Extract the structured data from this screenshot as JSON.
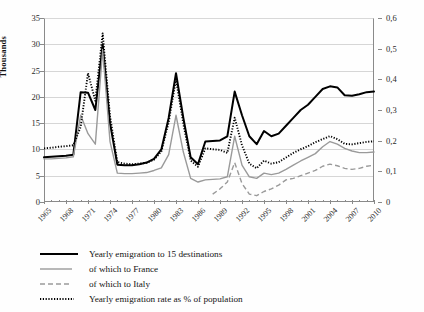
{
  "chart_data": {
    "type": "line",
    "title": "",
    "xlabel": "",
    "ylabel": "Thousands",
    "y2label": "",
    "xlim": [
      1965,
      2010
    ],
    "ylim": [
      0,
      35
    ],
    "y2lim": [
      0,
      0.6
    ],
    "grid": true,
    "legend_position": "bottom-left",
    "x": [
      1965,
      1966,
      1967,
      1968,
      1969,
      1970,
      1971,
      1972,
      1973,
      1974,
      1975,
      1976,
      1977,
      1978,
      1979,
      1980,
      1981,
      1982,
      1983,
      1984,
      1985,
      1986,
      1987,
      1988,
      1989,
      1990,
      1991,
      1992,
      1993,
      1994,
      1995,
      1996,
      1997,
      1998,
      1999,
      2000,
      2001,
      2002,
      2003,
      2004,
      2005,
      2006,
      2007,
      2008,
      2009,
      2010
    ],
    "y_left_ticks": [
      "0",
      "5",
      "10",
      "15",
      "20",
      "25",
      "30",
      "35"
    ],
    "y_right_ticks": [
      "0",
      "0,1",
      "0,2",
      "0,3",
      "0,4",
      "0,5",
      "0,6"
    ],
    "x_ticks": [
      "1965",
      "1968",
      "1971",
      "1974",
      "1977",
      "1980",
      "1983",
      "1986",
      "1989",
      "1992",
      "1995",
      "1998",
      "2001",
      "2004",
      "2007",
      "2010"
    ],
    "series": [
      {
        "name": "Yearly emigration to 15 destinations",
        "key": "total",
        "axis": "left",
        "style": "solid-thick",
        "color": "#000000",
        "values": [
          8.5,
          8.6,
          8.7,
          8.8,
          9.0,
          20.9,
          20.8,
          17.5,
          30.0,
          15.0,
          7.1,
          7.0,
          7.0,
          7.2,
          7.5,
          8.2,
          10.0,
          16.0,
          24.5,
          16.0,
          8.5,
          7.2,
          11.5,
          11.6,
          11.7,
          12.5,
          21.0,
          16.5,
          12.5,
          11.0,
          13.5,
          12.5,
          13.0,
          14.5,
          16.0,
          17.5,
          18.5,
          20.0,
          21.5,
          22.0,
          21.8,
          20.3,
          20.2,
          20.5,
          20.9,
          21.0
        ]
      },
      {
        "name": "of which to France",
        "key": "france",
        "axis": "left",
        "style": "solid-thin",
        "color": "#9a9a9a",
        "values": [
          8.2,
          8.2,
          8.3,
          8.4,
          8.6,
          16.5,
          13.0,
          11.0,
          29.0,
          11.5,
          5.5,
          5.4,
          5.4,
          5.5,
          5.6,
          6.0,
          6.5,
          9.0,
          16.5,
          9.5,
          4.5,
          3.8,
          4.2,
          4.3,
          4.4,
          4.8,
          12.5,
          7.0,
          4.8,
          4.5,
          5.5,
          5.2,
          5.5,
          6.2,
          7.0,
          7.8,
          8.5,
          9.2,
          10.5,
          11.5,
          11.0,
          10.2,
          9.7,
          9.4,
          9.4,
          9.5
        ]
      },
      {
        "name": "of which to Italy",
        "key": "italy",
        "axis": "left",
        "style": "dashed",
        "color": "#9a9a9a",
        "values": [
          null,
          null,
          null,
          null,
          null,
          null,
          null,
          null,
          null,
          null,
          null,
          null,
          null,
          null,
          null,
          null,
          null,
          null,
          null,
          null,
          null,
          null,
          null,
          1.5,
          2.5,
          3.8,
          7.5,
          3.5,
          1.5,
          1.2,
          2.0,
          2.5,
          3.2,
          4.2,
          4.5,
          5.0,
          5.5,
          6.0,
          6.8,
          7.2,
          6.9,
          6.4,
          6.2,
          6.4,
          6.8,
          7.0
        ]
      },
      {
        "name": "Yearly emigration rate as %  of population",
        "key": "rate",
        "axis": "right",
        "style": "dotted",
        "color": "#000000",
        "values": [
          0.175,
          0.177,
          0.18,
          0.182,
          0.185,
          0.245,
          0.42,
          0.33,
          0.55,
          0.28,
          0.13,
          0.125,
          0.123,
          0.125,
          0.128,
          0.138,
          0.165,
          0.26,
          0.4,
          0.255,
          0.135,
          0.115,
          0.175,
          0.172,
          0.17,
          0.16,
          0.275,
          0.185,
          0.125,
          0.11,
          0.135,
          0.125,
          0.13,
          0.145,
          0.16,
          0.172,
          0.182,
          0.195,
          0.205,
          0.215,
          0.205,
          0.19,
          0.188,
          0.192,
          0.196,
          0.198
        ]
      }
    ]
  },
  "axes": {
    "left_title": "Thousands",
    "left_ticks": [
      "35",
      "30",
      "25",
      "20",
      "15",
      "10",
      "5",
      "0"
    ],
    "right_ticks": [
      "0,6",
      "0,5",
      "0,4",
      "0,3",
      "0,2",
      "0,1",
      "0"
    ],
    "x_ticks": [
      "1965",
      "1968",
      "1971",
      "1974",
      "1977",
      "1980",
      "1983",
      "1986",
      "1989",
      "1992",
      "1995",
      "1998",
      "2001",
      "2004",
      "2007",
      "2010"
    ]
  },
  "legend": {
    "items": [
      {
        "label": "Yearly emigration to 15 destinations",
        "style": "solid-thick",
        "color": "#000000"
      },
      {
        "label": "of which to France",
        "style": "solid-thin",
        "color": "#9a9a9a"
      },
      {
        "label": "of which to Italy",
        "style": "dashed",
        "color": "#9a9a9a"
      },
      {
        "label": "Yearly emigration rate as %  of population",
        "style": "dotted",
        "color": "#000000"
      }
    ]
  },
  "colors": {
    "total": "#000000",
    "france": "#9a9a9a",
    "italy": "#9a9a9a",
    "rate": "#000000",
    "grid": "#d6d6d6",
    "axis": "#8a8a8a"
  }
}
